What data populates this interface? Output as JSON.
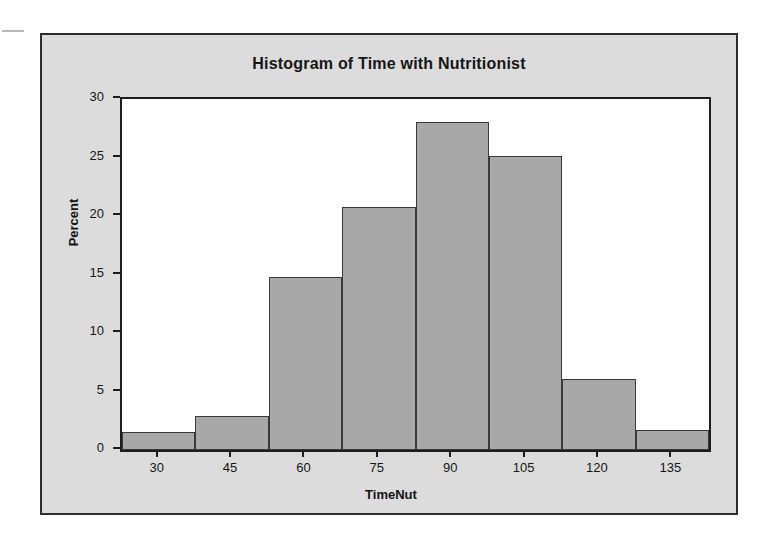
{
  "chart_data": {
    "type": "bar",
    "title": "Histogram of Time with Nutritionist",
    "xlabel": "TimeNut",
    "ylabel": "Percent",
    "categories": [
      "30",
      "45",
      "60",
      "75",
      "90",
      "105",
      "120",
      "135"
    ],
    "values": [
      1.5,
      2.9,
      14.8,
      20.8,
      28.0,
      25.1,
      6.1,
      1.7
    ],
    "bin_width": 15,
    "bin_edges": [
      22.5,
      37.5,
      52.5,
      67.5,
      82.5,
      97.5,
      112.5,
      127.5,
      142.5
    ],
    "xtick_labels": [
      "30",
      "45",
      "60",
      "75",
      "90",
      "105",
      "120",
      "135"
    ],
    "ytick_labels": [
      "0",
      "5",
      "10",
      "15",
      "20",
      "25",
      "30"
    ],
    "ytick_values": [
      0,
      5,
      10,
      15,
      20,
      25,
      30
    ],
    "ylim": [
      0,
      30
    ],
    "xlim": [
      22.5,
      142.5
    ],
    "grid": false,
    "legend": null,
    "bar_color": "#a8a8a8",
    "bar_edge_color": "#3a3a3a",
    "panel_background": "#ffffff",
    "figure_background": "#dcdcdc",
    "axis_color": "#1d1d1d"
  }
}
